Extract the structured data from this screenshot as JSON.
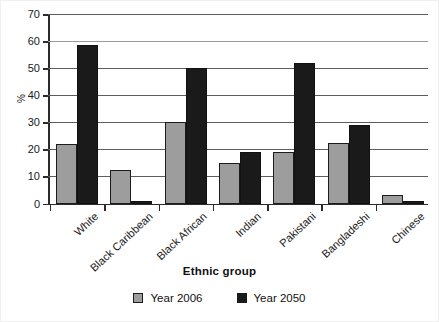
{
  "chart_data": {
    "type": "bar",
    "title": "",
    "xlabel": "Ethnic group",
    "ylabel": "%",
    "ylim": [
      0,
      70
    ],
    "yticks": [
      0,
      10,
      20,
      30,
      40,
      50,
      60,
      70
    ],
    "grid": true,
    "legend_position": "bottom-center",
    "categories": [
      "White",
      "Black Caribbean",
      "Black African",
      "Indian",
      "Pakistani",
      "Bangladeshi",
      "Chinese"
    ],
    "series": [
      {
        "name": "Year 2006",
        "color": "#9d9d9d",
        "values": [
          22,
          12.5,
          30,
          15,
          19,
          22.5,
          3
        ]
      },
      {
        "name": "Year 2050",
        "color": "#1a1a1a",
        "values": [
          58.5,
          1,
          50,
          19,
          52,
          29,
          1
        ]
      }
    ]
  },
  "legend": {
    "entries": [
      {
        "label": "Year 2006",
        "swatch": "gray-swatch"
      },
      {
        "label": "Year 2050",
        "swatch": "black-swatch"
      }
    ]
  },
  "axes": {
    "y_title": "%",
    "x_title": "Ethnic group"
  }
}
